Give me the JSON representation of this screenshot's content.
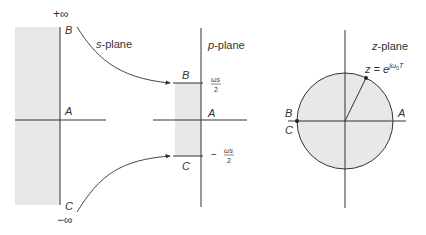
{
  "colors": {
    "line": "#333333",
    "shade": "#e6e6e6",
    "background": "#ffffff"
  },
  "s_plane": {
    "title_var": "s",
    "title_rest": "-plane",
    "plus_infinity": "+∞",
    "minus_infinity": "−∞",
    "point_B": "B",
    "point_A": "A",
    "point_C": "C"
  },
  "p_plane": {
    "title_var": "p",
    "title_rest": "-plane",
    "point_B": "B",
    "point_A": "A",
    "point_C": "C",
    "upper_num": "ωs",
    "upper_den": "2",
    "lower_sign": "−",
    "lower_num": "ωs",
    "lower_den": "2"
  },
  "z_plane": {
    "title_var": "z",
    "title_rest": "-plane",
    "equation_lhs": "z = e",
    "equation_exp": "jω",
    "equation_exp_sub": "0",
    "equation_exp_tail": "T",
    "point_B": "B",
    "point_C": "C",
    "point_A": "A"
  }
}
